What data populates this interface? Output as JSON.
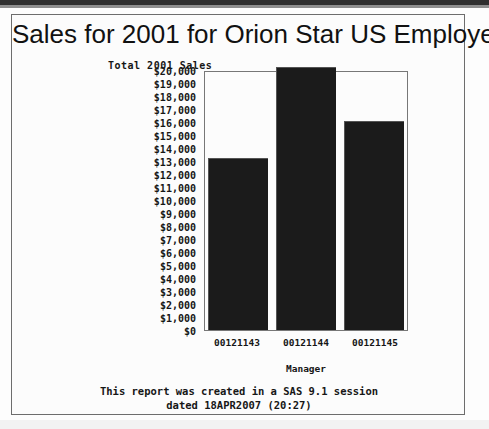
{
  "report": {
    "title": "Sales for 2001 for Orion Star US Employees",
    "footnote_line1": "This report was created in a SAS 9.1 session",
    "footnote_line2": "dated 18APR2007 (20:27)"
  },
  "chart_data": {
    "type": "bar",
    "title": "Sales for 2001 for Orion Star US Employees",
    "xlabel": "Manager",
    "ylabel": "Total 2001 Sales",
    "categories": [
      "00121143",
      "00121144",
      "00121145"
    ],
    "values": [
      13200,
      20200,
      16100
    ],
    "ylim": [
      0,
      20000
    ],
    "ytick_values": [
      0,
      1000,
      2000,
      3000,
      4000,
      5000,
      6000,
      7000,
      8000,
      9000,
      10000,
      11000,
      12000,
      13000,
      14000,
      15000,
      16000,
      17000,
      18000,
      19000,
      20000
    ],
    "ytick_labels": [
      "$0",
      "$1,000",
      "$2,000",
      "$3,000",
      "$4,000",
      "$5,000",
      "$6,000",
      "$7,000",
      "$8,000",
      "$9,000",
      "$10,000",
      "$11,000",
      "$12,000",
      "$13,000",
      "$14,000",
      "$15,000",
      "$16,000",
      "$17,000",
      "$18,000",
      "$19,000",
      "$20,000"
    ],
    "grid": false,
    "legend": null,
    "bar_color": "#1b1b1b",
    "plot_background": "#fcfcfc"
  }
}
